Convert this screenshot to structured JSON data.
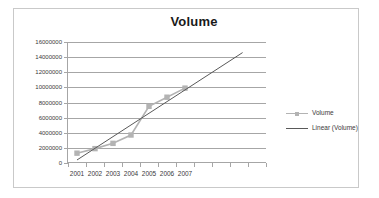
{
  "chart_data": {
    "type": "line",
    "title": "Volume",
    "xlabel": "",
    "ylabel": "",
    "grid": true,
    "legend_position": "right",
    "categories": [
      "2001",
      "2002",
      "2003",
      "2004",
      "2005",
      "2006",
      "2007"
    ],
    "ylim": [
      0,
      16000000
    ],
    "ytick_labels": [
      "16000000",
      "14000000",
      "12000000",
      "10000000",
      "8000000",
      "6000000",
      "4000000",
      "2000000",
      "0"
    ],
    "ytick_values": [
      16000000,
      14000000,
      12000000,
      10000000,
      8000000,
      6000000,
      4000000,
      2000000,
      0
    ],
    "series": [
      {
        "name": "Volume",
        "kind": "line-marker",
        "color": "#b3b3b3",
        "marker": "square",
        "values": [
          1300000,
          1900000,
          2600000,
          3700000,
          7500000,
          8700000,
          9900000
        ]
      },
      {
        "name": "Linear (Volume)",
        "kind": "trendline",
        "color": "#595959",
        "endpoints": [
          {
            "x_index": 0,
            "y": 400000
          },
          {
            "x_index": 9.2,
            "y": 14600000
          }
        ]
      }
    ],
    "legend_entries": [
      {
        "label": "Volume",
        "key": "line-with-square-marker",
        "color": "#b3b3b3"
      },
      {
        "label": "Linear (Volume)",
        "key": "plain-line",
        "color": "#595959"
      }
    ],
    "axis_color": "#a6a6a6",
    "plot_background": "#ffffff",
    "chart_border_color": "#c9c9c9"
  }
}
